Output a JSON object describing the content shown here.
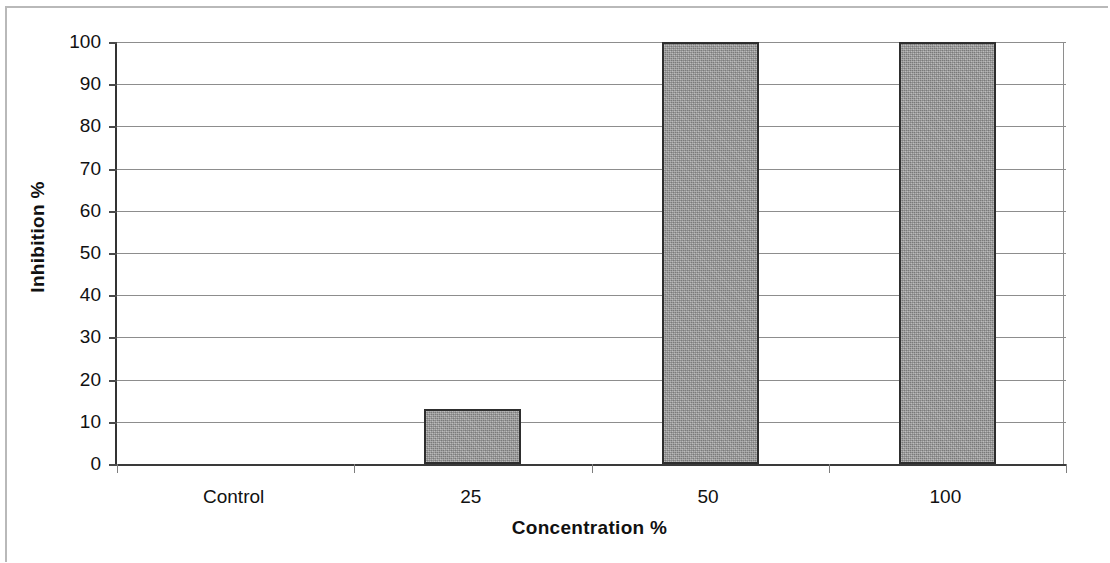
{
  "chart_data": {
    "type": "bar",
    "title": "",
    "subtitle": "",
    "xlabel": "Concentration %",
    "ylabel": "Inhibition %",
    "categories": [
      "Control",
      "25",
      "50",
      "100"
    ],
    "values": [
      0,
      13,
      100,
      100
    ],
    "series": [
      {
        "name": "Inhibition",
        "values": [
          0,
          13,
          100,
          100
        ]
      }
    ],
    "ylim": [
      0,
      100
    ],
    "ytick_labels": [
      "100",
      "90",
      "80",
      "70",
      "60",
      "50",
      "40",
      "30",
      "20",
      "10",
      "0"
    ],
    "ytick_values": [
      100,
      90,
      80,
      70,
      60,
      50,
      40,
      30,
      20,
      10,
      0
    ],
    "ytick_step": 10,
    "grid": true,
    "grid_axis": "y",
    "legend": false,
    "legend_position": "none",
    "bar_fill_color": "#9c9c9c",
    "bar_border_color": "#2e2e2e",
    "gridline_color": "#8d8d8d",
    "axis_color": "#3a3a3a",
    "text_color": "#111111",
    "background_color": "#ffffff"
  },
  "figure": {
    "border_color": "#b9b9b9"
  }
}
